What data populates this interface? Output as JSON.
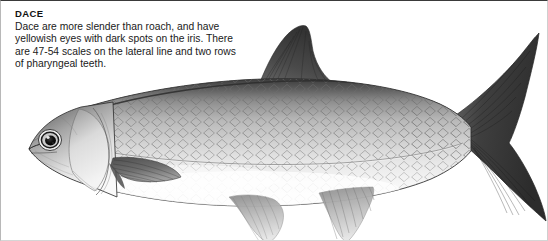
{
  "page": {
    "heading": "DACE",
    "description_lines": [
      "Dace are more slender than roach, and have",
      "yellowish eyes with dark spots on the iris. There",
      "are 47-54 scales on the lateral line and two rows",
      "of pharyngeal teeth."
    ],
    "description_full": "Dace are more slender than roach, and have yellowish eyes with dark spots on the iris. There are 47-54 scales on the lateral line and two rows of pharyngeal teeth."
  },
  "illustration": {
    "subject": "dace-fish",
    "caption": "",
    "style": "grayscale-pencil-drawing",
    "orientation": "left-facing-head",
    "parts": [
      "dorsal-fin",
      "caudal-fin",
      "anal-fin",
      "pelvic-fin",
      "pectoral-fin",
      "eye",
      "gill-cover",
      "lateral-line",
      "scales"
    ],
    "colors": {
      "dorsal_dark": "#4a4a4a",
      "body_mid": "#b5b5b5",
      "belly_light": "#f7f7f7",
      "fin_dark": "#3f3f3f",
      "fin_light": "#a8a8a8",
      "outline": "#2e2e2e"
    }
  },
  "frame": {
    "border_top_color": "#3a3a3a",
    "border_side_color": "#c8c8c8",
    "background": "#ffffff"
  }
}
